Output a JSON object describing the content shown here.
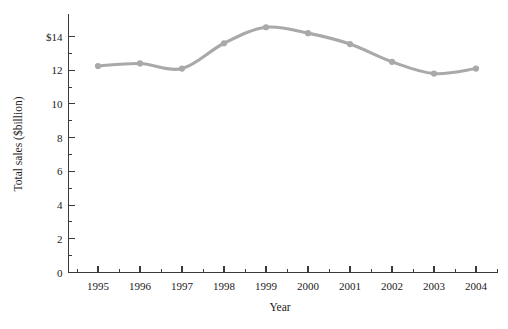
{
  "chart_data": {
    "type": "line",
    "title": "",
    "subtitle": "",
    "xlabel": "Year",
    "ylabel": "Total sales ($billion)",
    "categories": [
      "1995",
      "1996",
      "1997",
      "1998",
      "1999",
      "2000",
      "2001",
      "2002",
      "2003",
      "2004"
    ],
    "x": [
      1995,
      1996,
      1997,
      1998,
      1999,
      2000,
      2001,
      2002,
      2003,
      2004
    ],
    "values": [
      12.25,
      12.4,
      12.1,
      13.6,
      14.55,
      14.2,
      13.55,
      12.5,
      11.8,
      12.1
    ],
    "series": [
      {
        "name": "Total sales",
        "values": [
          12.25,
          12.4,
          12.1,
          13.6,
          14.55,
          14.2,
          13.55,
          12.5,
          11.8,
          12.1
        ],
        "color": "#a9a9a9",
        "marker": "circle"
      }
    ],
    "ylim": [
      0,
      15
    ],
    "xlim": [
      1994.5,
      2005.0
    ],
    "yticks": [
      0,
      2,
      4,
      6,
      8,
      10,
      12,
      14
    ],
    "ytick_labels": [
      "0",
      "2",
      "4",
      "6",
      "8",
      "10",
      "12",
      "$14"
    ],
    "y_minor_ticks": [
      1,
      3,
      5,
      7,
      9,
      11,
      13
    ],
    "grid": false,
    "legend": false,
    "legend_position": "none",
    "line_color": "#a9a9a9",
    "axis_color": "#3a3a3a",
    "background": "#ffffff"
  },
  "axes": {
    "y_title": "Total sales ($billion)",
    "x_title": "Year"
  }
}
